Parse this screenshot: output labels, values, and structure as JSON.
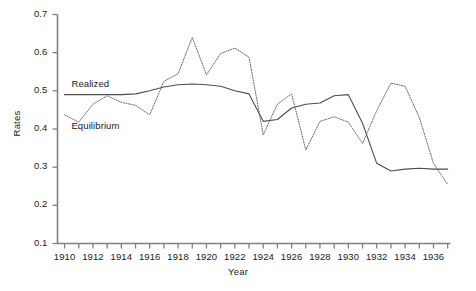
{
  "chart_data": {
    "type": "line",
    "title": "",
    "xlabel": "Year",
    "ylabel": "Rates",
    "xlim": [
      1909.5,
      1937.2
    ],
    "ylim": [
      0.1,
      0.7
    ],
    "grid": false,
    "legend_position": "inline-annotation",
    "y_ticks": [
      "0.1",
      "0.2",
      "0.3",
      "0.4",
      "0.5",
      "0.6",
      "0.7"
    ],
    "y_tick_values": [
      0.1,
      0.2,
      0.3,
      0.4,
      0.5,
      0.6,
      0.7
    ],
    "x_ticks": [
      "1910",
      "1912",
      "1914",
      "1916",
      "1918",
      "1920",
      "1922",
      "1924",
      "1926",
      "1928",
      "1930",
      "1932",
      "1934",
      "1936"
    ],
    "x_tick_values": [
      1910,
      1912,
      1914,
      1916,
      1918,
      1920,
      1922,
      1924,
      1926,
      1928,
      1930,
      1932,
      1934,
      1936
    ],
    "x_minor_tick_values": [
      1911,
      1913,
      1915,
      1917,
      1919,
      1921,
      1923,
      1925,
      1927,
      1929,
      1931,
      1933,
      1935,
      1937
    ],
    "x": [
      1910,
      1911,
      1912,
      1913,
      1914,
      1915,
      1916,
      1917,
      1918,
      1919,
      1920,
      1921,
      1922,
      1923,
      1924,
      1925,
      1926,
      1927,
      1928,
      1929,
      1930,
      1931,
      1932,
      1933,
      1934,
      1935,
      1936,
      1937
    ],
    "series": [
      {
        "name": "Realized",
        "style": "solid",
        "color": "#4d4d4d",
        "values": [
          0.49,
          0.49,
          0.49,
          0.49,
          0.49,
          0.492,
          0.5,
          0.51,
          0.516,
          0.518,
          0.516,
          0.512,
          0.5,
          0.492,
          0.42,
          0.425,
          0.455,
          0.465,
          0.468,
          0.487,
          0.49,
          0.415,
          0.31,
          0.29,
          0.295,
          0.297,
          0.295,
          0.295
        ]
      },
      {
        "name": "Equilibrium",
        "style": "dotted",
        "color": "#6a6a6a",
        "values": [
          0.437,
          0.418,
          0.465,
          0.487,
          0.47,
          0.462,
          0.437,
          0.525,
          0.545,
          0.64,
          0.542,
          0.598,
          0.612,
          0.588,
          0.385,
          0.465,
          0.492,
          0.345,
          0.42,
          0.432,
          0.418,
          0.362,
          0.448,
          0.52,
          0.512,
          0.43,
          0.31,
          0.255
        ]
      }
    ],
    "annotations": [
      {
        "text": "Realized",
        "x": 1910.2,
        "y": 0.515
      },
      {
        "text": "Equilibrium",
        "x": 1910.2,
        "y": 0.405
      }
    ]
  }
}
